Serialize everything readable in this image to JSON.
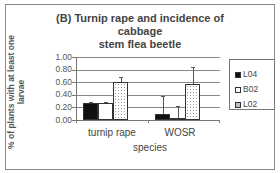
{
  "chart_data": {
    "type": "bar",
    "title": "(B) Turnip rape and incidence of cabbage stem flea beetle",
    "title_lines": [
      "(B) Turnip rape and incidence of cabbage",
      "stem flea beetle"
    ],
    "xlabel": "species",
    "ylabel": "% of plants with at least one larvae",
    "categories": [
      "turnip rape",
      "WOSR"
    ],
    "yticks": [
      "0.00",
      "0.20",
      "0.40",
      "0.60",
      "0.80",
      "1.00"
    ],
    "ylim": [
      0,
      1.0
    ],
    "grid": true,
    "legend_position": "right",
    "series": [
      {
        "name": "L04",
        "values": [
          0.27,
          0.09
        ],
        "errors": [
          0.02,
          0.29
        ],
        "fill": "#111111"
      },
      {
        "name": "B02",
        "values": [
          0.27,
          0.02
        ],
        "errors": [
          0.02,
          0.21
        ],
        "fill": "#ffffff"
      },
      {
        "name": "L02",
        "values": [
          0.61,
          0.57
        ],
        "errors": [
          0.08,
          0.27
        ],
        "fill": "dotted"
      }
    ]
  }
}
